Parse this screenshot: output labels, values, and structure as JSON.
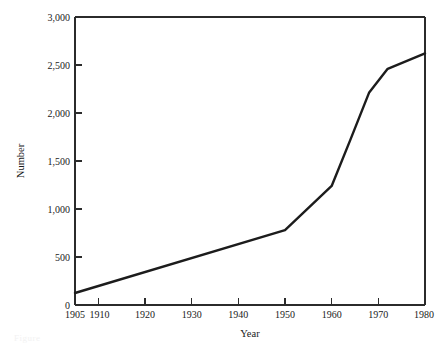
{
  "chart_data": {
    "type": "line",
    "title": "",
    "subtitle": "",
    "xlabel": "Year",
    "ylabel": "Number",
    "xlim": [
      1905,
      1980
    ],
    "ylim": [
      0,
      3000
    ],
    "grid": false,
    "legend": null,
    "legend_position": "none",
    "x_ticks": [
      1905,
      1910,
      1920,
      1930,
      1940,
      1950,
      1960,
      1970,
      1980
    ],
    "x_tick_labels": [
      "1905",
      "1910",
      "1920",
      "1930",
      "1940",
      "1950",
      "1960",
      "1970",
      "1980"
    ],
    "y_ticks": [
      0,
      500,
      1000,
      1500,
      2000,
      2500,
      3000
    ],
    "y_tick_labels": [
      "0",
      "500",
      "1,000",
      "1,500",
      "2,000",
      "2,500",
      "3,000"
    ],
    "series": [
      {
        "name": "Number",
        "color": "#1c1c1c",
        "x": [
          1905,
          1950,
          1960,
          1964,
          1968,
          1972,
          1980
        ],
        "values": [
          125,
          780,
          1240,
          1720,
          2210,
          2460,
          2620
        ]
      }
    ],
    "annotations": []
  },
  "axes": {
    "y_axis_title": "Number",
    "x_axis_title": "Year"
  },
  "figure": {
    "caption_partial": "Figure"
  },
  "colors": {
    "line": "#1c1c1c",
    "axis": "#2b2b2b",
    "text": "#1a1a1a",
    "background": "#ffffff"
  }
}
